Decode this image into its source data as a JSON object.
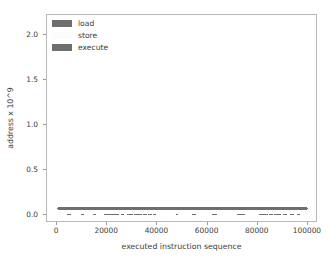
{
  "chart_data": {
    "type": "scatter",
    "title": "",
    "xlabel": "executed instruction sequence",
    "ylabel": "address x 10^9",
    "xlim": [
      -4000,
      104000
    ],
    "ylim": [
      -0.09,
      2.22
    ],
    "xticks": [
      0,
      20000,
      40000,
      60000,
      80000,
      100000
    ],
    "xticklabels": [
      "0",
      "20000",
      "40000",
      "60000",
      "80000",
      "100000"
    ],
    "yticks": [
      0.0,
      0.5,
      1.0,
      1.5,
      2.0
    ],
    "yticklabels": [
      "0.0",
      "0.5",
      "1.0",
      "1.5",
      "2.0"
    ],
    "grid": false,
    "legend_position": "upper left",
    "legend_frame": false,
    "series": [
      {
        "name": "load",
        "color": "#6e6e6e",
        "marker": "square",
        "marker_size": 1.6,
        "points": [
          [
            4200,
            0.004
          ],
          [
            4600,
            0.004
          ],
          [
            5000,
            0.004
          ],
          [
            5400,
            0.004
          ],
          [
            9800,
            0.004
          ],
          [
            10300,
            0.004
          ],
          [
            14600,
            0.004
          ],
          [
            15100,
            0.004
          ],
          [
            19000,
            0.004
          ],
          [
            19400,
            0.004
          ],
          [
            19800,
            0.004
          ],
          [
            20200,
            0.004
          ],
          [
            20600,
            0.004
          ],
          [
            21000,
            0.004
          ],
          [
            21400,
            0.004
          ],
          [
            21800,
            0.004
          ],
          [
            22200,
            0.004
          ],
          [
            22600,
            0.004
          ],
          [
            23000,
            0.004
          ],
          [
            23400,
            0.004
          ],
          [
            23800,
            0.004
          ],
          [
            24200,
            0.004
          ],
          [
            26000,
            0.004
          ],
          [
            26400,
            0.004
          ],
          [
            28200,
            0.004
          ],
          [
            28600,
            0.004
          ],
          [
            29000,
            0.004
          ],
          [
            29400,
            0.004
          ],
          [
            29800,
            0.004
          ],
          [
            31000,
            0.004
          ],
          [
            31400,
            0.004
          ],
          [
            31800,
            0.004
          ],
          [
            32200,
            0.004
          ],
          [
            32600,
            0.004
          ],
          [
            33000,
            0.004
          ],
          [
            33400,
            0.004
          ],
          [
            34600,
            0.004
          ],
          [
            35000,
            0.004
          ],
          [
            35400,
            0.004
          ],
          [
            36600,
            0.004
          ],
          [
            37000,
            0.004
          ],
          [
            37400,
            0.004
          ],
          [
            38600,
            0.004
          ],
          [
            39000,
            0.004
          ],
          [
            47800,
            0.004
          ],
          [
            54200,
            0.004
          ],
          [
            54600,
            0.004
          ],
          [
            55000,
            0.004
          ],
          [
            62200,
            0.004
          ],
          [
            62600,
            0.004
          ],
          [
            63000,
            0.004
          ],
          [
            63400,
            0.004
          ],
          [
            72200,
            0.004
          ],
          [
            72600,
            0.004
          ],
          [
            73000,
            0.004
          ],
          [
            73400,
            0.004
          ],
          [
            73800,
            0.004
          ],
          [
            74200,
            0.004
          ],
          [
            74600,
            0.004
          ],
          [
            81000,
            0.004
          ],
          [
            81400,
            0.004
          ],
          [
            81800,
            0.004
          ],
          [
            82200,
            0.004
          ],
          [
            82600,
            0.004
          ],
          [
            83000,
            0.004
          ],
          [
            83400,
            0.004
          ],
          [
            83800,
            0.004
          ],
          [
            85000,
            0.004
          ],
          [
            85600,
            0.004
          ],
          [
            87000,
            0.004
          ],
          [
            87600,
            0.004
          ],
          [
            88200,
            0.004
          ],
          [
            88800,
            0.004
          ],
          [
            90200,
            0.004
          ],
          [
            90800,
            0.004
          ],
          [
            91400,
            0.004
          ],
          [
            93000,
            0.004
          ],
          [
            93600,
            0.004
          ],
          [
            94200,
            0.004
          ],
          [
            95800,
            0.004
          ],
          [
            96400,
            0.004
          ]
        ]
      },
      {
        "name": "store",
        "color": "#fbfbfb",
        "marker": "square",
        "marker_size": 1.6,
        "points": [
          [
            23000,
            2.105
          ],
          [
            24200,
            2.105
          ],
          [
            25800,
            2.105
          ],
          [
            27200,
            2.105
          ],
          [
            29000,
            2.105
          ],
          [
            30600,
            2.105
          ],
          [
            32000,
            2.105
          ],
          [
            33400,
            2.105
          ],
          [
            35000,
            2.105
          ],
          [
            36600,
            2.105
          ],
          [
            38200,
            2.105
          ],
          [
            39800,
            2.105
          ],
          [
            41400,
            2.105
          ],
          [
            43000,
            2.105
          ],
          [
            48000,
            2.105
          ],
          [
            49400,
            2.105
          ],
          [
            55000,
            2.105
          ],
          [
            56600,
            2.105
          ],
          [
            58200,
            2.105
          ],
          [
            59800,
            2.105
          ],
          [
            61400,
            2.105
          ],
          [
            63000,
            2.105
          ],
          [
            64600,
            2.105
          ],
          [
            66200,
            2.105
          ],
          [
            67800,
            2.105
          ],
          [
            69400,
            2.105
          ],
          [
            71000,
            2.105
          ],
          [
            72600,
            2.105
          ],
          [
            74200,
            2.105
          ],
          [
            76000,
            2.105
          ],
          [
            78000,
            2.105
          ],
          [
            80000,
            2.105
          ]
        ]
      },
      {
        "name": "execute",
        "color": "#6e6e6e",
        "marker": "square",
        "marker_size": 1.6,
        "band": {
          "y_min": 0.055,
          "y_max": 0.085,
          "x_min": 500,
          "x_max": 99500
        },
        "points": [
          [
            500,
            0.07
          ],
          [
            99500,
            0.07
          ]
        ]
      }
    ]
  },
  "legend": {
    "entries": [
      {
        "label": "load",
        "color": "#6e6e6e"
      },
      {
        "label": "store",
        "color": "#fbfbfb"
      },
      {
        "label": "execute",
        "color": "#6e6e6e"
      }
    ]
  }
}
